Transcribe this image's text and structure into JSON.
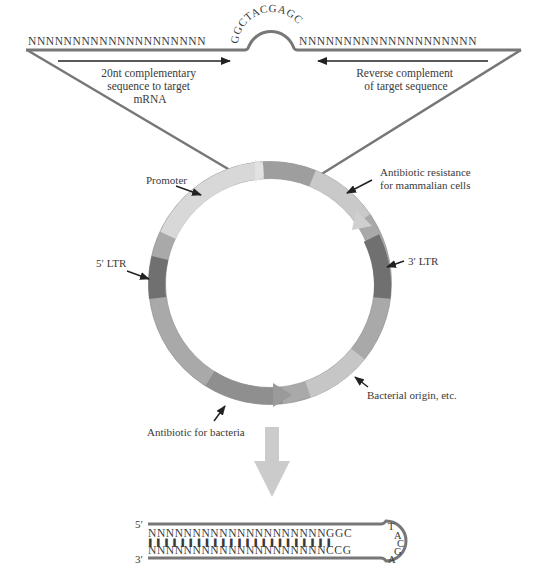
{
  "shrna_construct": {
    "left_stem": "NNNNNNNNNNNNNNNNNNNN",
    "loop": "GGCTACGAGC",
    "right_stem": "NNNNNNNNNNNNNNNNNNNN",
    "left_arrow_label": [
      "20nt complementary",
      "sequence to target",
      "mRNA"
    ],
    "right_arrow_label": [
      "Reverse complement",
      "of target sequence"
    ]
  },
  "plasmid": {
    "labels": {
      "promoter": "Promoter",
      "mammalian_resistance": [
        "Antibiotic resistance",
        "for mammalian cells"
      ],
      "ltr3": "3′ LTR",
      "ltr5": "5′ LTR",
      "bacterial_origin": "Bacterial origin, etc.",
      "bacterial_antibiotic": "Antibiotic for bacteria"
    },
    "colors": {
      "backbone": "#a8a8a8",
      "promoter": "#d6d6d6",
      "ltr": "#6e6e6e",
      "light_segment": "#c4c4c4"
    }
  },
  "hairpin": {
    "five_prime": "5′",
    "three_prime": "3′",
    "top_strand": "NNNNNNNNNNNNNNNNNNNNGGC",
    "bottom_strand": "NNNNNNNNNNNNNNNNNNNNCCG",
    "pairs": "▌▌▌▌▌▌▌▌▌▌▌▌▌▌▌▌▌▌▌▌▌▌▌",
    "loop": [
      "T",
      "A",
      "C",
      "G",
      "A"
    ]
  },
  "arrow_color": "#c8c8c8"
}
